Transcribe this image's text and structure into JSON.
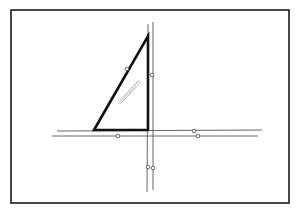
{
  "diagram": {
    "type": "technical-drawing",
    "colors": {
      "background": "#ffffff",
      "frame": "#1a1a1a",
      "triangle": "#111111",
      "rails": "#555555",
      "markers": "#444444",
      "hatch": "#9a9a9a"
    },
    "frame": {
      "x": 11,
      "y": 10,
      "width": 278,
      "height": 193
    },
    "triangle": {
      "points": [
        [
          94,
          130
        ],
        [
          148,
          36
        ],
        [
          148,
          130
        ]
      ]
    },
    "vertical_rails": [
      {
        "x1": 148,
        "y1": 24,
        "x2": 147,
        "y2": 192
      },
      {
        "x1": 153,
        "y1": 22,
        "x2": 153,
        "y2": 190
      }
    ],
    "horizontal_rails": [
      {
        "x1": 57,
        "y1": 131,
        "x2": 262,
        "y2": 130
      },
      {
        "x1": 52,
        "y1": 136,
        "x2": 258,
        "y2": 136
      }
    ],
    "markers": [
      {
        "cx": 127,
        "cy": 69
      },
      {
        "cx": 152,
        "cy": 75
      },
      {
        "cx": 118,
        "cy": 136
      },
      {
        "cx": 194,
        "cy": 131
      },
      {
        "cx": 198,
        "cy": 136
      },
      {
        "cx": 148,
        "cy": 167
      },
      {
        "cx": 153,
        "cy": 168
      }
    ],
    "hatch_lines": [
      {
        "x1": 118,
        "y1": 104,
        "x2": 140,
        "y2": 80
      },
      {
        "x1": 120,
        "y1": 104,
        "x2": 141,
        "y2": 82
      },
      {
        "x1": 119,
        "y1": 101,
        "x2": 138,
        "y2": 81
      },
      {
        "x1": 122,
        "y1": 102,
        "x2": 136,
        "y2": 87
      }
    ]
  }
}
